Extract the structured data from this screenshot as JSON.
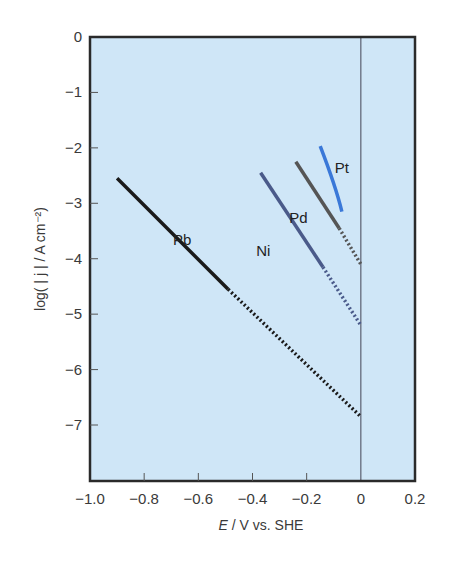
{
  "chart_data": {
    "type": "line",
    "title": "",
    "xlabel": "E / V vs. SHE",
    "xlabel_italic_part": "E",
    "xlabel_rest": " / V vs. SHE",
    "ylabel": "log( | j | / A cm⁻²)",
    "xlim": [
      -1.0,
      0.2
    ],
    "ylim": [
      -7.9,
      0
    ],
    "x_ticks": [
      -1.0,
      -0.8,
      -0.6,
      -0.4,
      -0.2,
      0,
      0.2
    ],
    "x_tick_labels": [
      "−1.0",
      "−0.8",
      "−0.6",
      "−0.4",
      "−0.2",
      "0",
      "0.2"
    ],
    "y_ticks": [
      0,
      -1,
      -2,
      -3,
      -4,
      -5,
      -6,
      -7
    ],
    "y_tick_labels": [
      "0",
      "−1",
      "−2",
      "−3",
      "−4",
      "−5",
      "−6",
      "−7"
    ],
    "grid": false,
    "reference_line": {
      "x": 0,
      "label": "E = 0 V"
    },
    "background_color": "#cfe6f7",
    "legend": "inline labels",
    "series": [
      {
        "name": "Pb",
        "color": "#1a1a1a",
        "solid": {
          "x": [
            -0.9,
            -0.49
          ],
          "y": [
            -2.55,
            -4.55
          ]
        },
        "extrapolated_dotted": {
          "x": [
            -0.49,
            0.0
          ],
          "y": [
            -4.55,
            -6.85
          ]
        },
        "label_pos": {
          "x": -0.66,
          "y": -3.75
        }
      },
      {
        "name": "Ni",
        "color": "#4a5a8a",
        "solid": {
          "x": [
            -0.37,
            -0.14
          ],
          "y": [
            -2.45,
            -4.15
          ]
        },
        "extrapolated_dotted": {
          "x": [
            -0.14,
            0.0
          ],
          "y": [
            -4.15,
            -5.2
          ]
        },
        "label_pos": {
          "x": -0.36,
          "y": -3.95
        }
      },
      {
        "name": "Pd",
        "color": "#555555",
        "solid": {
          "x": [
            -0.24,
            -0.08
          ],
          "y": [
            -2.25,
            -3.45
          ]
        },
        "extrapolated_dotted": {
          "x": [
            -0.08,
            0.0
          ],
          "y": [
            -3.45,
            -4.1
          ]
        },
        "label_pos": {
          "x": -0.23,
          "y": -3.35
        }
      },
      {
        "name": "Pt",
        "color": "#3a78d8",
        "solid_curve": {
          "x": [
            -0.15,
            -0.12,
            -0.09,
            -0.07
          ],
          "y": [
            -1.97,
            -2.35,
            -2.75,
            -3.15
          ]
        },
        "label_pos": {
          "x": -0.07,
          "y": -2.45
        }
      }
    ]
  }
}
